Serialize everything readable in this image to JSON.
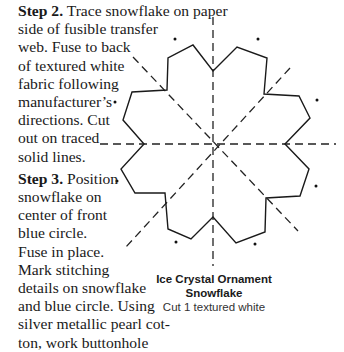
{
  "instructions": {
    "step2": {
      "label": "Step 2.",
      "lines": [
        " Trace snowflake on paper",
        "side of fusible transfer",
        "web. Fuse to back",
        "of textured white",
        "fabric following",
        "manufacturer’s",
        "directions. Cut",
        "out on traced",
        "solid lines."
      ]
    },
    "step3": {
      "label": "Step 3.",
      "lines": [
        " Position",
        "snowflake on",
        "center of front",
        "blue circle.",
        "Fuse in place.",
        "Mark stitching",
        "details on snowflake",
        "and blue circle. Using",
        "silver metallic pearl cot-",
        "ton, work buttonhole"
      ]
    }
  },
  "pattern": {
    "title_line1": "Ice Crystal Ornament",
    "title_line2": "Snowflake",
    "instruction": "Cut 1 textured white",
    "line_color": "#1a1a1a"
  }
}
